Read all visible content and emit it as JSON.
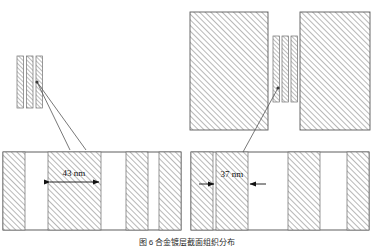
{
  "figure": {
    "type": "cross-section-schematic",
    "caption": "图 6  合金镀层截面组织分布",
    "panels": [
      {
        "id": "left",
        "name": "left-panel",
        "overview_label": "thin-lamellae-stack",
        "lamella_count": 3,
        "detail_label": "43 nm",
        "dimension_value": 43,
        "dimension_unit": "nm",
        "arrow_style": "outward-double",
        "band_count": 5
      },
      {
        "id": "right",
        "name": "right-panel",
        "overview_label": "block-gap-lamellae",
        "lamella_count": 3,
        "block_count": 2,
        "detail_label": "37 nm",
        "dimension_value": 37,
        "dimension_unit": "nm",
        "arrow_style": "inward-double",
        "band_count": 5
      }
    ]
  },
  "labels": {
    "left_dimension": "43 nm",
    "right_dimension": "37 nm",
    "caption": "图 6  合金镀层截面组织分布"
  },
  "colors": {
    "hatch": "#9a9a9a",
    "outline": "#4d4d4d",
    "leader": "#555555",
    "text": "#111111",
    "background": "#ffffff",
    "caption": "#2b2b2b"
  }
}
